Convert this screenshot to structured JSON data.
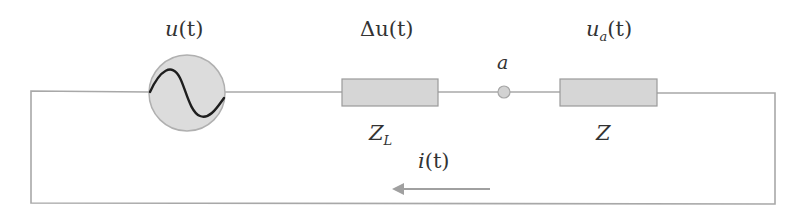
{
  "diagram": {
    "type": "series-circuit",
    "colors": {
      "wire": "#a8a8a8",
      "component_fill": "#d6d6d6",
      "component_stroke": "#9a9a9a",
      "source_fill": "#dcdcdc",
      "sine": "#1e1e1e",
      "arrow": "#a0a0a0",
      "text": "#333333"
    },
    "source": {
      "label": "u",
      "arg": "(t)"
    },
    "line_impedance": {
      "voltage_label": "Δu",
      "voltage_arg": "(t)",
      "name": "Z",
      "name_sub": "L"
    },
    "node": {
      "label": "a"
    },
    "load": {
      "voltage_label": "u",
      "voltage_sub": "a",
      "voltage_arg": "(t)",
      "name": "Z"
    },
    "current": {
      "label": "i",
      "arg": "(t)",
      "direction": "left"
    }
  }
}
